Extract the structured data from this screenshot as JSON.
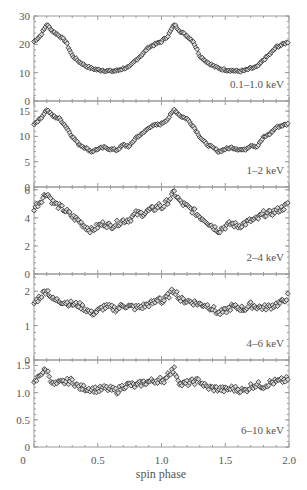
{
  "chart_data": {
    "type": "scatter",
    "title": "",
    "xlabel": "spin phase",
    "xlim": [
      0,
      2.0
    ],
    "x_ticks": [
      "0",
      "0.5",
      "1.0",
      "1.5",
      "2.0"
    ],
    "x_tick_values": [
      0,
      0.5,
      1.0,
      1.5,
      2.0
    ],
    "layout": "5 vertically stacked panels sharing x-axis; pulse profile repeated twice (phase 0-2)",
    "marker": "open diamond",
    "grid": false,
    "panels": [
      {
        "label": "0.1–1.0 keV",
        "ylim": [
          0,
          30
        ],
        "y_ticks": [
          "0",
          "10",
          "20",
          "30"
        ],
        "y_tick_values": [
          0,
          10,
          20,
          30
        ],
        "phase": [
          0.0,
          0.05,
          0.1,
          0.15,
          0.2,
          0.25,
          0.3,
          0.35,
          0.4,
          0.45,
          0.5,
          0.55,
          0.6,
          0.65,
          0.7,
          0.75,
          0.8,
          0.85,
          0.9,
          0.95,
          1.0
        ],
        "values": [
          21,
          23,
          27,
          24.5,
          23,
          21,
          16,
          14,
          12.5,
          11.5,
          11,
          10.8,
          10.5,
          10.7,
          11.5,
          12,
          14.5,
          16.5,
          19,
          20,
          21
        ]
      },
      {
        "label": "1–2 keV",
        "ylim": [
          0,
          17
        ],
        "y_ticks": [
          "0",
          "5",
          "10",
          "15"
        ],
        "y_tick_values": [
          0,
          5,
          10,
          15
        ],
        "phase": [
          0.0,
          0.05,
          0.1,
          0.15,
          0.2,
          0.25,
          0.3,
          0.35,
          0.4,
          0.45,
          0.5,
          0.55,
          0.6,
          0.65,
          0.7,
          0.75,
          0.8,
          0.85,
          0.9,
          0.95,
          1.0
        ],
        "values": [
          12.5,
          13.5,
          15.3,
          14,
          13.5,
          12,
          10,
          8.5,
          7.8,
          7,
          7.5,
          7.8,
          7.5,
          7.3,
          8.3,
          8,
          9.8,
          10.5,
          11.8,
          12.2,
          12.5
        ]
      },
      {
        "label": "2–4 keV",
        "ylim": [
          0,
          6.2
        ],
        "y_ticks": [
          "0",
          "2",
          "4",
          "6"
        ],
        "y_tick_values": [
          0,
          2,
          4,
          6
        ],
        "phase": [
          0.0,
          0.05,
          0.1,
          0.15,
          0.2,
          0.25,
          0.3,
          0.35,
          0.4,
          0.45,
          0.5,
          0.55,
          0.6,
          0.65,
          0.7,
          0.75,
          0.8,
          0.85,
          0.9,
          0.95,
          1.0
        ],
        "values": [
          4.7,
          5.2,
          5.8,
          5.1,
          4.8,
          4.5,
          4.1,
          3.8,
          3.4,
          3.1,
          3.4,
          3.6,
          3.4,
          3.6,
          3.8,
          3.9,
          4.3,
          4.3,
          4.5,
          4.7,
          5.0
        ]
      },
      {
        "label": "4–6 keV",
        "ylim": [
          0,
          2.5
        ],
        "y_ticks": [
          "0",
          "1",
          "2"
        ],
        "y_tick_values": [
          0,
          1,
          2
        ],
        "phase": [
          0.0,
          0.05,
          0.1,
          0.15,
          0.2,
          0.25,
          0.3,
          0.35,
          0.4,
          0.45,
          0.5,
          0.55,
          0.6,
          0.65,
          0.7,
          0.75,
          0.8,
          0.85,
          0.9,
          0.95,
          1.0
        ],
        "values": [
          1.65,
          1.85,
          2.05,
          1.75,
          1.72,
          1.68,
          1.62,
          1.6,
          1.5,
          1.35,
          1.42,
          1.55,
          1.52,
          1.48,
          1.6,
          1.55,
          1.52,
          1.55,
          1.62,
          1.68,
          1.9
        ]
      },
      {
        "label": "6–10 keV",
        "ylim": [
          0,
          1.6
        ],
        "y_ticks": [
          "0",
          "0.5",
          "1.0",
          "1.5"
        ],
        "y_tick_values": [
          0,
          0.5,
          1.0,
          1.5
        ],
        "phase": [
          0.0,
          0.05,
          0.1,
          0.15,
          0.2,
          0.25,
          0.3,
          0.35,
          0.4,
          0.45,
          0.5,
          0.55,
          0.6,
          0.65,
          0.7,
          0.75,
          0.8,
          0.85,
          0.9,
          0.95,
          1.0
        ],
        "values": [
          1.15,
          1.35,
          1.42,
          1.15,
          1.17,
          1.2,
          1.22,
          1.1,
          1.08,
          1.07,
          1.05,
          1.08,
          1.06,
          1.03,
          1.12,
          1.15,
          1.12,
          1.18,
          1.2,
          1.22,
          1.25
        ]
      }
    ]
  },
  "colors": {
    "frame": "#9a9a9a",
    "marker_edge": "#2a2a2a",
    "text": "#555555",
    "background": "#ffffff"
  }
}
